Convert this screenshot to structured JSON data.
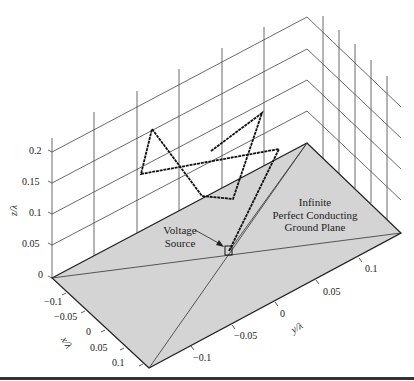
{
  "figure": {
    "annotations": {
      "ground_plane": [
        "Infinite",
        "Perfect Conducting",
        "Ground Plane"
      ],
      "voltage_source": [
        "Voltage",
        "Source"
      ]
    },
    "axes": {
      "z": {
        "label": "z/λ",
        "ticks": [
          "0",
          "0.05",
          "0.1",
          "0.15",
          "0.2"
        ]
      },
      "x": {
        "label": "x/λ",
        "ticks": [
          "−0.1",
          "−0.05",
          "0",
          "0.05",
          "0.1"
        ]
      },
      "y": {
        "label": "y/λ",
        "ticks": [
          "−0.1",
          "−0.05",
          "0",
          "0.05",
          "0.1"
        ]
      }
    },
    "colors": {
      "ground_plane_fill": "#d4d4d4",
      "grid": "#333333",
      "wire": "#111111",
      "bottom_rule": "#333333"
    }
  }
}
